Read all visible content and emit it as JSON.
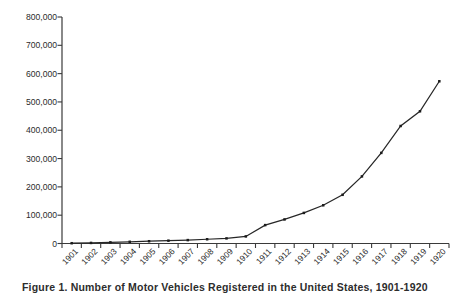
{
  "caption": {
    "text": "Figure 1. Number of Motor Vehicles Registered in the United States, 1901-1920"
  },
  "chart_data": {
    "type": "line",
    "title": "",
    "xlabel": "",
    "ylabel": "",
    "categories": [
      "1901",
      "1902",
      "1903",
      "1904",
      "1905",
      "1906",
      "1907",
      "1908",
      "1909",
      "1910",
      "1911",
      "1912",
      "1913",
      "1914",
      "1915",
      "1916",
      "1917",
      "1918",
      "1919",
      "1920"
    ],
    "values": [
      1000,
      2000,
      4000,
      6000,
      8000,
      10000,
      12000,
      15000,
      18000,
      25000,
      65000,
      85000,
      108000,
      135000,
      172000,
      237000,
      320000,
      415000,
      467000,
      573000
    ],
    "series": [
      {
        "name": "Registrations",
        "values": [
          1000,
          2000,
          4000,
          6000,
          8000,
          10000,
          12000,
          15000,
          18000,
          25000,
          65000,
          85000,
          108000,
          135000,
          172000,
          237000,
          320000,
          415000,
          467000,
          573000
        ]
      }
    ],
    "ylim": [
      0,
      800000
    ],
    "yticks": [
      0,
      100000,
      200000,
      300000,
      400000,
      500000,
      600000,
      700000,
      800000
    ],
    "ytick_labels": [
      "0",
      "100,000",
      "200,000",
      "300,000",
      "400,000",
      "500,000",
      "600,000",
      "700,000",
      "800,000"
    ],
    "grid": false,
    "legend": "none",
    "marker": "square",
    "line_color": "#272727",
    "marker_color": "#1c1c1c",
    "axis_color": "#3a3a3a",
    "background": "#ffffff",
    "xlabel_rotation": -45
  }
}
